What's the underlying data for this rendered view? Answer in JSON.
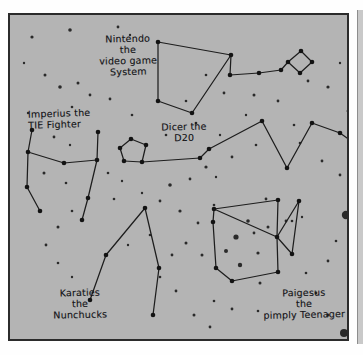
{
  "page": {
    "kind": "hand-drawn star chart",
    "background_color": "#b4b4b4",
    "ink_color": "#1d1d1d",
    "paper_color": "#fefefe",
    "frame_color": "#2b2b2b"
  },
  "labels": {
    "nintendo": "Nintendo\nthe\nvideo game\nSystem",
    "imperius": "Imperius the\nTIE Fighter",
    "dicer": "Dicer the\nD20",
    "karaties": "Karaties\nthe\nNunchucks",
    "paigesus": "Paigesus\nthe\npimply Teenager"
  },
  "constellations": [
    {
      "name": "Nintendo the video game System",
      "stars": [
        [
          148,
          27
        ],
        [
          148,
          86
        ],
        [
          182,
          98
        ],
        [
          221,
          40
        ],
        [
          220,
          60
        ],
        [
          249,
          58
        ],
        [
          271,
          55
        ],
        [
          278,
          47
        ],
        [
          291,
          36
        ],
        [
          302,
          47
        ],
        [
          290,
          58
        ]
      ],
      "lines": [
        [
          [
            148,
            27
          ],
          [
            221,
            40
          ]
        ],
        [
          [
            221,
            40
          ],
          [
            182,
            98
          ]
        ],
        [
          [
            182,
            98
          ],
          [
            148,
            86
          ]
        ],
        [
          [
            148,
            86
          ],
          [
            148,
            27
          ]
        ],
        [
          [
            221,
            40
          ],
          [
            220,
            60
          ]
        ],
        [
          [
            220,
            60
          ],
          [
            249,
            58
          ]
        ],
        [
          [
            249,
            58
          ],
          [
            271,
            55
          ]
        ],
        [
          [
            271,
            55
          ],
          [
            278,
            47
          ]
        ],
        [
          [
            278,
            47
          ],
          [
            291,
            36
          ]
        ],
        [
          [
            291,
            36
          ],
          [
            302,
            47
          ]
        ],
        [
          [
            302,
            47
          ],
          [
            290,
            58
          ]
        ],
        [
          [
            290,
            58
          ],
          [
            278,
            47
          ]
        ]
      ]
    },
    {
      "name": "Imperius the TIE Fighter",
      "stars": [
        [
          22,
          115
        ],
        [
          18,
          137
        ],
        [
          17,
          172
        ],
        [
          30,
          196
        ],
        [
          54,
          148
        ],
        [
          87,
          145
        ],
        [
          88,
          117
        ],
        [
          78,
          183
        ],
        [
          72,
          205
        ]
      ],
      "lines": [
        [
          [
            22,
            115
          ],
          [
            18,
            137
          ]
        ],
        [
          [
            18,
            137
          ],
          [
            54,
            148
          ]
        ],
        [
          [
            54,
            148
          ],
          [
            87,
            145
          ]
        ],
        [
          [
            87,
            145
          ],
          [
            88,
            117
          ]
        ],
        [
          [
            18,
            137
          ],
          [
            17,
            172
          ]
        ],
        [
          [
            17,
            172
          ],
          [
            30,
            196
          ]
        ],
        [
          [
            87,
            145
          ],
          [
            78,
            183
          ]
        ],
        [
          [
            78,
            183
          ],
          [
            72,
            205
          ]
        ]
      ]
    },
    {
      "name": "Dicer the D20",
      "stars": [
        [
          121,
          124
        ],
        [
          110,
          133
        ],
        [
          114,
          146
        ],
        [
          132,
          147
        ],
        [
          136,
          130
        ],
        [
          190,
          143
        ],
        [
          199,
          134
        ],
        [
          252,
          106
        ],
        [
          277,
          153
        ],
        [
          302,
          108
        ],
        [
          330,
          118
        ],
        [
          341,
          126
        ]
      ],
      "lines": [
        [
          [
            136,
            130
          ],
          [
            121,
            124
          ]
        ],
        [
          [
            121,
            124
          ],
          [
            110,
            133
          ]
        ],
        [
          [
            110,
            133
          ],
          [
            114,
            146
          ]
        ],
        [
          [
            114,
            146
          ],
          [
            132,
            147
          ]
        ],
        [
          [
            132,
            147
          ],
          [
            136,
            130
          ]
        ],
        [
          [
            132,
            147
          ],
          [
            190,
            143
          ]
        ],
        [
          [
            190,
            143
          ],
          [
            199,
            134
          ]
        ],
        [
          [
            199,
            134
          ],
          [
            252,
            106
          ]
        ],
        [
          [
            252,
            106
          ],
          [
            277,
            153
          ]
        ],
        [
          [
            277,
            153
          ],
          [
            302,
            108
          ]
        ],
        [
          [
            302,
            108
          ],
          [
            330,
            118
          ]
        ],
        [
          [
            330,
            118
          ],
          [
            341,
            126
          ]
        ]
      ]
    },
    {
      "name": "Karaties the Nunchucks",
      "stars": [
        [
          135,
          193
        ],
        [
          96,
          240
        ],
        [
          80,
          285
        ],
        [
          149,
          253
        ],
        [
          143,
          300
        ]
      ],
      "lines": [
        [
          [
            80,
            285
          ],
          [
            96,
            240
          ]
        ],
        [
          [
            96,
            240
          ],
          [
            135,
            193
          ]
        ],
        [
          [
            135,
            193
          ],
          [
            149,
            253
          ]
        ],
        [
          [
            149,
            253
          ],
          [
            143,
            300
          ]
        ]
      ]
    },
    {
      "name": "Paigesus the pimply Teenager",
      "stars": [
        [
          203,
          207
        ],
        [
          206,
          253
        ],
        [
          222,
          266
        ],
        [
          268,
          257
        ],
        [
          267,
          222
        ],
        [
          204,
          194
        ],
        [
          268,
          185
        ],
        [
          282,
          239
        ],
        [
          289,
          186
        ]
      ],
      "lines": [
        [
          [
            204,
            194
          ],
          [
            203,
            207
          ]
        ],
        [
          [
            203,
            207
          ],
          [
            206,
            253
          ]
        ],
        [
          [
            206,
            253
          ],
          [
            222,
            266
          ]
        ],
        [
          [
            222,
            266
          ],
          [
            268,
            257
          ]
        ],
        [
          [
            268,
            257
          ],
          [
            267,
            222
          ]
        ],
        [
          [
            267,
            222
          ],
          [
            204,
            194
          ]
        ],
        [
          [
            204,
            194
          ],
          [
            268,
            185
          ]
        ],
        [
          [
            268,
            185
          ],
          [
            267,
            222
          ]
        ],
        [
          [
            267,
            222
          ],
          [
            289,
            186
          ]
        ],
        [
          [
            289,
            186
          ],
          [
            282,
            239
          ]
        ],
        [
          [
            282,
            239
          ],
          [
            267,
            222
          ]
        ]
      ]
    }
  ],
  "background_stars": [
    [
      22,
      22,
      1.6
    ],
    [
      60,
      15,
      1.8
    ],
    [
      108,
      12,
      1.4
    ],
    [
      14,
      48,
      1.2
    ],
    [
      35,
      60,
      1.5
    ],
    [
      50,
      72,
      1.8
    ],
    [
      68,
      68,
      1.5
    ],
    [
      80,
      80,
      1.4
    ],
    [
      62,
      92,
      1.3
    ],
    [
      100,
      84,
      1.4
    ],
    [
      18,
      98,
      1.2
    ],
    [
      120,
      20,
      1.2
    ],
    [
      196,
      60,
      1.3
    ],
    [
      214,
      78,
      1.4
    ],
    [
      176,
      86,
      1.3
    ],
    [
      244,
      80,
      1.5
    ],
    [
      268,
      86,
      1.4
    ],
    [
      298,
      66,
      1.4
    ],
    [
      318,
      72,
      1.6
    ],
    [
      330,
      48,
      1.2
    ],
    [
      186,
      108,
      1.3
    ],
    [
      236,
      100,
      1.2
    ],
    [
      122,
      100,
      1.3
    ],
    [
      44,
      122,
      1.4
    ],
    [
      60,
      130,
      1.2
    ],
    [
      34,
      158,
      1.5
    ],
    [
      56,
      168,
      1.3
    ],
    [
      98,
      158,
      1.3
    ],
    [
      112,
      166,
      1.2
    ],
    [
      156,
      120,
      1.3
    ],
    [
      210,
      120,
      1.2
    ],
    [
      246,
      130,
      1.3
    ],
    [
      290,
      128,
      1.3
    ],
    [
      312,
      146,
      1.4
    ],
    [
      196,
      152,
      1.6
    ],
    [
      206,
      162,
      1.2
    ],
    [
      222,
      142,
      1.4
    ],
    [
      160,
      170,
      1.8
    ],
    [
      180,
      164,
      1.4
    ],
    [
      104,
      184,
      1.3
    ],
    [
      132,
      178,
      1.2
    ],
    [
      150,
      186,
      1.4
    ],
    [
      62,
      196,
      1.3
    ],
    [
      48,
      212,
      1.5
    ],
    [
      170,
      196,
      1.6
    ],
    [
      188,
      208,
      1.4
    ],
    [
      176,
      228,
      1.5
    ],
    [
      204,
      190,
      1.3
    ],
    [
      162,
      240,
      1.4
    ],
    [
      140,
      220,
      1.3
    ],
    [
      118,
      230,
      1.2
    ],
    [
      192,
      240,
      1.5
    ],
    [
      150,
      262,
      1.3
    ],
    [
      166,
      276,
      1.4
    ],
    [
      48,
      248,
      1.3
    ],
    [
      62,
      262,
      1.2
    ],
    [
      36,
      230,
      1.4
    ],
    [
      204,
      286,
      1.3
    ],
    [
      222,
      294,
      1.4
    ],
    [
      184,
      300,
      1.5
    ],
    [
      200,
      312,
      1.4
    ],
    [
      248,
      296,
      1.3
    ],
    [
      318,
      300,
      1.6
    ],
    [
      306,
      278,
      1.4
    ],
    [
      296,
      258,
      1.3
    ],
    [
      226,
      222,
      2.6
    ],
    [
      238,
      206,
      1.8
    ],
    [
      216,
      236,
      2.0
    ],
    [
      230,
      250,
      2.2
    ],
    [
      248,
      238,
      1.6
    ],
    [
      258,
      212,
      1.5
    ],
    [
      244,
      218,
      1.4
    ],
    [
      276,
      206,
      1.4
    ],
    [
      250,
      268,
      1.5
    ],
    [
      336,
      200,
      4.2
    ],
    [
      334,
      318,
      4.0
    ],
    [
      330,
      160,
      1.4
    ],
    [
      326,
      226,
      1.3
    ],
    [
      318,
      246,
      1.4
    ],
    [
      282,
      206,
      1.3
    ],
    [
      292,
      202,
      1.2
    ],
    [
      338,
      96,
      1.4
    ],
    [
      284,
      110,
      1.3
    ],
    [
      256,
      184,
      1.4
    ]
  ]
}
